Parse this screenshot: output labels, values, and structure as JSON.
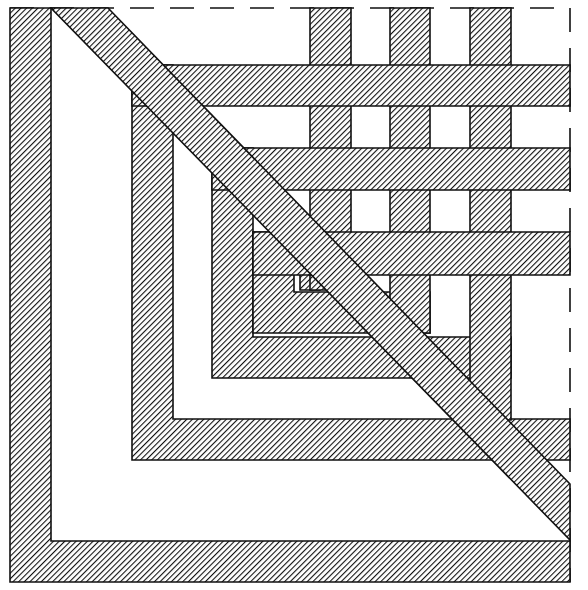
{
  "diagram": {
    "width": 588,
    "height": 590,
    "colors": {
      "background": "#ffffff",
      "stroke": "#111111",
      "hatch": "#111111",
      "dash": "#111111"
    },
    "hatch": {
      "angle": 45,
      "spacing": 4,
      "line_width": 1.8
    },
    "frame": {
      "x1": 10,
      "y1": 8,
      "x2": 570,
      "y2": 582,
      "style": "dashed"
    },
    "l_shapes": [
      {
        "id": "outer",
        "x": 10,
        "y": 8,
        "band": 41,
        "right": 570,
        "bottom": 582
      },
      {
        "id": "second",
        "x": 132,
        "y": 65,
        "band": 41,
        "right": 570,
        "bottom": 460
      },
      {
        "id": "third",
        "x": 212,
        "y": 148,
        "band": 41,
        "right": 511,
        "bottom": 378
      },
      {
        "id": "fourth",
        "x": 253,
        "y": 232,
        "band": 41,
        "right": 430,
        "bottom": 333
      }
    ],
    "horizontal_bands": [
      {
        "y": 65,
        "height": 41,
        "x1": 132,
        "x2": 570
      },
      {
        "y": 148,
        "height": 42,
        "x1": 212,
        "x2": 570
      },
      {
        "y": 232,
        "height": 43,
        "x1": 253,
        "x2": 570
      }
    ],
    "vertical_bars": [
      {
        "x": 310,
        "width": 41,
        "y1": 8,
        "y2": 290
      },
      {
        "x": 390,
        "width": 40,
        "y1": 8,
        "y2": 333
      },
      {
        "x": 470,
        "width": 41,
        "y1": 8,
        "y2": 420
      }
    ],
    "small_square": {
      "x": 300,
      "y": 265,
      "w": 20,
      "h": 25
    },
    "diagonal": {
      "points": "51,8 108,8 570,484 570,540"
    }
  }
}
